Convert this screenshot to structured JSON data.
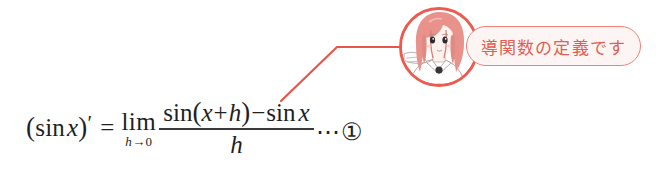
{
  "page": {
    "background_color": "#ffffff",
    "width": 669,
    "height": 177
  },
  "formula": {
    "description": "Definition of the derivative of sine",
    "lhs_open_paren": "(",
    "lhs_function": "sin",
    "lhs_variable": "x",
    "lhs_close_paren": ")",
    "prime": "′",
    "equals": "=",
    "limit_operator": "lim",
    "limit_subscript_variable": "h",
    "limit_subscript_arrow": "→",
    "limit_subscript_value": "0",
    "numerator_fn1": "sin",
    "numerator_open_paren": "(",
    "numerator_var": "x",
    "numerator_plus": "+",
    "numerator_h": "h",
    "numerator_close_paren": ")",
    "numerator_minus": "−",
    "numerator_fn2": "sin",
    "numerator_var2": "x",
    "denominator": "h",
    "ellipsis": "⋯",
    "equation_tag": "①",
    "text_color": "#211f1f",
    "full_text": "(sin x)′ = lim_{h→0} ( sin(x+h) − sin x ) / h ⋯①"
  },
  "pointer": {
    "name": "callout-connector-line",
    "color": "#e8564a",
    "points": "281,101 337,47 401,47"
  },
  "avatar": {
    "name": "character-portrait",
    "description": "Circular anime character portrait with pink-red hair and collared shirt",
    "border_color": "#ec5b4f",
    "hair_color": "#e88b84",
    "skin_color": "#fdf1ec",
    "line_color": "#9a8f8c"
  },
  "speech_bubble": {
    "text": "導関数の定義です",
    "border_color": "#ef8179",
    "fill_color": "#fdf5f4",
    "text_color": "#e35d52"
  }
}
